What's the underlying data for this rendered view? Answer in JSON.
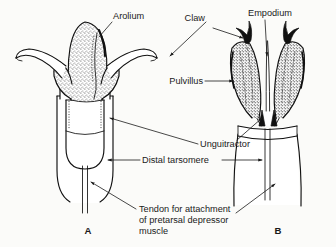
{
  "figure": {
    "kind": "line-drawing",
    "background_color": "#fbfbf9",
    "ink_color": "#111111"
  },
  "labels": {
    "arolium": "Arolium",
    "claw": "Claw",
    "empodium": "Empodium",
    "pulvillus": "Pulvillus",
    "unguitractor": "Unguitractor",
    "distal_tarsomere": "Distal tarsomere",
    "tendon_line1": "Tendon for attachment",
    "tendon_line2": "of pretarsal depressor",
    "tendon_line3": "muscle"
  },
  "panels": {
    "left": "A",
    "right": "B"
  }
}
